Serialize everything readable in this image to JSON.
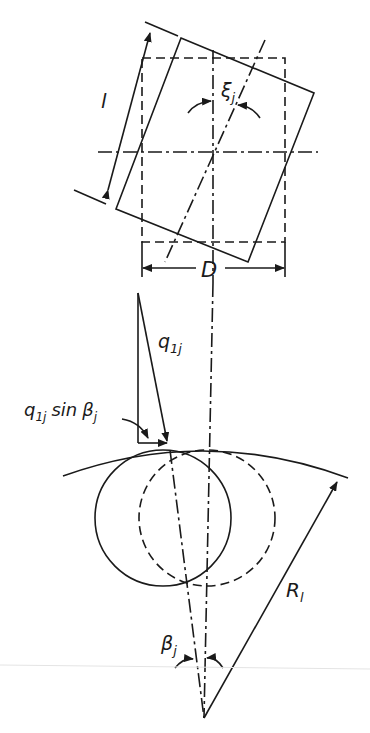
{
  "figure": {
    "type": "engineering schematic"
  },
  "labels": {
    "length": "l",
    "skew_angle": "ξ",
    "skew_angle_sub": "j",
    "diameter": "D",
    "load": "q",
    "load_sub": "1j",
    "load_component_q": "q",
    "load_component_sub": "1j",
    "load_component_sin": "sin",
    "load_component_beta": "β",
    "load_component_beta_sub": "j",
    "tilt_angle": "β",
    "tilt_angle_sub": "j",
    "radius": "R",
    "radius_sub": "l"
  },
  "colors": {
    "line": "#1a1a1a",
    "background": "#ffffff"
  }
}
